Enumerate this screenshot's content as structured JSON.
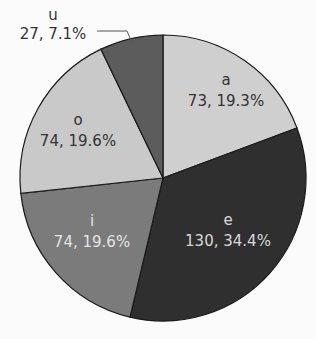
{
  "chart_data": {
    "type": "pie",
    "title": "",
    "categories": [
      "a",
      "e",
      "i",
      "o",
      "u"
    ],
    "values": [
      73,
      130,
      74,
      74,
      27
    ],
    "percentages": [
      19.3,
      34.4,
      19.6,
      19.6,
      7.1
    ],
    "labels": [
      "73, 19.3%",
      "130, 34.4%",
      "74, 19.6%",
      "74, 19.6%",
      "27, 7.1%"
    ],
    "colors": [
      "#cfcfcf",
      "#2f2f2f",
      "#7b7b7b",
      "#c9c9c9",
      "#5c5c5c"
    ],
    "start_angle": "12 o'clock, clockwise",
    "legend": "none (inline labels)"
  },
  "slices": [
    {
      "name": "a",
      "value_label": "73, 19.3%"
    },
    {
      "name": "e",
      "value_label": "130, 34.4%"
    },
    {
      "name": "i",
      "value_label": "74, 19.6%"
    },
    {
      "name": "o",
      "value_label": "74, 19.6%"
    },
    {
      "name": "u",
      "value_label": "27, 7.1%"
    }
  ]
}
